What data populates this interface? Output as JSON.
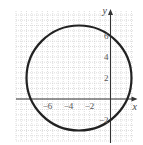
{
  "chart_data": {
    "type": "line",
    "title": "",
    "xlabel": "x",
    "ylabel": "y",
    "xlim": [
      -9,
      2
    ],
    "ylim": [
      -4,
      8
    ],
    "grid": true,
    "x_ticks": [
      {
        "value": -6,
        "label": "−6"
      },
      {
        "value": -4,
        "label": "−4"
      },
      {
        "value": -2,
        "label": "−2"
      }
    ],
    "y_ticks": [
      {
        "value": 6,
        "label": "6"
      },
      {
        "value": 4,
        "label": "4"
      },
      {
        "value": 2,
        "label": "2"
      },
      {
        "value": -2,
        "label": "−2"
      }
    ],
    "series": [
      {
        "name": "circle",
        "shape": "circle",
        "center": [
          -3,
          2
        ],
        "radius": 5
      }
    ]
  }
}
